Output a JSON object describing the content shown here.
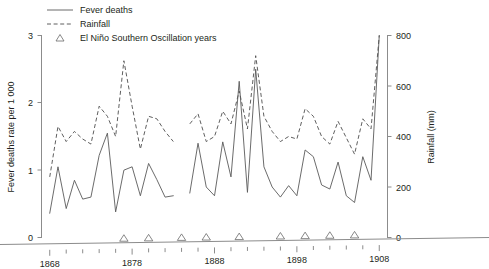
{
  "chart_data": {
    "type": "line",
    "title": "",
    "subtitle": "",
    "xlabel": "",
    "ylabel": "Fever deaths rate per 1 000",
    "y2label": "Rainfall (mm)",
    "xlim": [
      1867,
      1909
    ],
    "ylim": [
      0,
      3
    ],
    "y2lim": [
      0,
      800
    ],
    "grid": false,
    "legend_position": "top-left",
    "x_ticks_major": [
      1868,
      1878,
      1888,
      1898,
      1908
    ],
    "x_ticks_minor": [
      1870,
      1872,
      1874,
      1876,
      1880,
      1882,
      1884,
      1886,
      1890,
      1892,
      1894,
      1896,
      1900,
      1902,
      1904,
      1906
    ],
    "y_ticks": [
      0,
      1,
      2,
      3
    ],
    "y2_ticks": [
      0,
      200,
      400,
      600,
      800
    ],
    "x": [
      1868,
      1869,
      1870,
      1871,
      1872,
      1873,
      1874,
      1875,
      1876,
      1877,
      1878,
      1879,
      1880,
      1881,
      1882,
      1883,
      1884,
      1885,
      1886,
      1887,
      1888,
      1889,
      1890,
      1891,
      1892,
      1893,
      1894,
      1895,
      1896,
      1897,
      1898,
      1899,
      1900,
      1901,
      1902,
      1903,
      1904,
      1905,
      1906,
      1907,
      1908
    ],
    "series": [
      {
        "name": "Fever deaths",
        "style": "solid",
        "axis": "left",
        "unit": "deaths per 1 000",
        "values": [
          0.36,
          1.05,
          0.43,
          0.85,
          0.57,
          0.6,
          1.22,
          1.55,
          0.38,
          1.0,
          1.05,
          0.62,
          1.1,
          0.86,
          0.6,
          0.62,
          null,
          0.66,
          1.4,
          0.75,
          0.62,
          1.42,
          0.9,
          2.32,
          0.67,
          2.5,
          1.05,
          0.75,
          0.6,
          0.77,
          0.62,
          1.3,
          1.2,
          0.78,
          0.72,
          1.12,
          0.62,
          0.52,
          1.2,
          0.85,
          3.0
        ]
      },
      {
        "name": "Rainfall",
        "style": "dashed",
        "axis": "right",
        "unit": "mm",
        "values": [
          240,
          440,
          380,
          420,
          390,
          370,
          520,
          480,
          400,
          700,
          520,
          350,
          480,
          470,
          420,
          380,
          null,
          450,
          490,
          380,
          400,
          500,
          450,
          580,
          430,
          720,
          480,
          420,
          380,
          400,
          390,
          510,
          480,
          400,
          370,
          460,
          395,
          330,
          470,
          430,
          800
        ]
      }
    ],
    "enso_years": [
      1877,
      1880,
      1884,
      1887,
      1891,
      1896,
      1899,
      1902,
      1905
    ],
    "annotations": []
  },
  "legend": {
    "items": [
      {
        "label": "Fever deaths",
        "marker": "solid-line"
      },
      {
        "label": "Rainfall",
        "marker": "dashed-line"
      },
      {
        "label": "El Niño Southern Oscillation years",
        "marker": "triangle"
      }
    ]
  },
  "axes": {
    "left": {
      "title": "Fever deaths rate per 1 000",
      "tick_labels": [
        "0",
        "1",
        "2",
        "3"
      ]
    },
    "right": {
      "title": "Rainfall (mm)",
      "tick_labels": [
        "0",
        "200",
        "400",
        "600",
        "800"
      ]
    },
    "bottom": {
      "tick_labels": [
        "1868",
        "1878",
        "1888",
        "1898",
        "1908"
      ]
    }
  },
  "colors": {
    "deaths_line": "#5a5a5a",
    "rainfall_line": "#4d4d4d",
    "axis": "#8c8c8c",
    "text": "#231f20",
    "background": "#ffffff"
  }
}
